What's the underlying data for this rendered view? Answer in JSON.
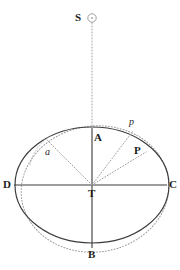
{
  "figure": {
    "type": "geometric-diagram",
    "title_text": "",
    "background_color": "#ffffff",
    "line_color": "#3a3a3a",
    "dotted_color": "#8f8f8f",
    "label_color": "#1d1d1d",
    "canvas": {
      "width": 180,
      "height": 270
    }
  },
  "labels": {
    "sun": "S",
    "apex_top": "A",
    "apex_bottom": "B",
    "axis_right": "C",
    "axis_left": "D",
    "center": "T",
    "point_p_upper": "p",
    "point_p_lower": "P",
    "angle_a": "a"
  },
  "geometry": {
    "ellipse": {
      "center_x": 92,
      "center_y": 185,
      "radius_x": 77,
      "radius_y": 58
    },
    "dotted_circle": {
      "center_x": 95,
      "center_y": 189,
      "radius_x": 74,
      "radius_y": 63,
      "rotation_deg": -8
    },
    "sun": {
      "x": 92,
      "y": 18,
      "radius": 4
    },
    "major_axis": {
      "x1": 14,
      "y1": 185,
      "x2": 167,
      "y2": 185
    },
    "minor_axis": {
      "x1": 92,
      "y1": 128,
      "x2": 92,
      "y2": 248
    },
    "sun_ray": {
      "x1": 92,
      "y1": 24,
      "x2": 92,
      "y2": 128
    },
    "radial_lines": [
      {
        "name": "radial-to-a",
        "x1": 92,
        "y1": 185,
        "x2": 47,
        "y2": 140
      },
      {
        "name": "radial-to-p-upper",
        "x1": 92,
        "y1": 185,
        "x2": 133,
        "y2": 132
      },
      {
        "name": "radial-to-P-lower",
        "x1": 92,
        "y1": 185,
        "x2": 145,
        "y2": 153
      }
    ]
  },
  "label_positions": {
    "sun": {
      "x": 75,
      "y": 13
    },
    "apex_top": {
      "x": 95,
      "y": 133
    },
    "apex_bottom": {
      "x": 88,
      "y": 250
    },
    "axis_right": {
      "x": 169,
      "y": 180
    },
    "axis_left": {
      "x": 4,
      "y": 180
    },
    "center": {
      "x": 88,
      "y": 188
    },
    "p_upper": {
      "x": 128,
      "y": 119
    },
    "p_lower": {
      "x": 133,
      "y": 146
    },
    "angle_a": {
      "x": 45,
      "y": 146
    }
  }
}
